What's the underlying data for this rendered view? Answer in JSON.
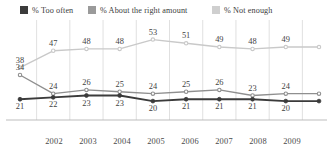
{
  "legend": {
    "items": [
      {
        "label": "% Too often",
        "color": "#3b3b3b",
        "swatch_name": "legend-swatch-too-often",
        "x": 20
      },
      {
        "label": "% About the right amount",
        "color": "#9a9a9a",
        "swatch_name": "legend-swatch-about-right",
        "x": 88
      },
      {
        "label": "% Not enough",
        "color": "#cfcfcf",
        "swatch_name": "legend-swatch-not-enough",
        "x": 212
      }
    ]
  },
  "chart_data": {
    "type": "line",
    "title": "",
    "subtitle": "",
    "xlabel": "",
    "ylabel": "",
    "grid": true,
    "legend_position": "top",
    "ylim": [
      0,
      60
    ],
    "xlim": [
      0,
      9
    ],
    "x": [
      0,
      1,
      2,
      3,
      4,
      5,
      6,
      7,
      8,
      9
    ],
    "categories": [
      "",
      "2002",
      "2003",
      "2004",
      "2005",
      "2006",
      "2007",
      "2008",
      "2009",
      ""
    ],
    "tick_labels": [
      "2002",
      "2003",
      "2004",
      "2005",
      "2006",
      "2007",
      "2008",
      "2009"
    ],
    "series": [
      {
        "name": "% Not enough",
        "color": "#c9c9c9",
        "marker": "open-circle",
        "values": [
          38,
          47,
          48,
          48,
          53,
          51,
          49,
          48,
          49,
          49
        ],
        "labels": [
          "38",
          "47",
          "48",
          "48",
          "53",
          "51",
          "49",
          "48",
          "49",
          ""
        ]
      },
      {
        "name": "% About the right amount",
        "color": "#8f8f8f",
        "marker": "open-circle",
        "values": [
          34,
          24,
          26,
          25,
          24,
          25,
          26,
          23,
          24,
          24
        ],
        "labels": [
          "34",
          "24",
          "26",
          "25",
          "24",
          "25",
          "26",
          "23",
          "24",
          ""
        ]
      },
      {
        "name": "% Too often",
        "color": "#3b3b3b",
        "marker": "filled-circle",
        "values": [
          21,
          22,
          23,
          23,
          20,
          21,
          21,
          21,
          20,
          20
        ],
        "labels": [
          "21",
          "22",
          "23",
          "23",
          "20",
          "21",
          "21",
          "21",
          "20",
          ""
        ]
      }
    ]
  },
  "axis": {
    "ticks": [
      {
        "label": "2002",
        "x": 54
      },
      {
        "label": "2003",
        "x": 88
      },
      {
        "label": "2004",
        "x": 122
      },
      {
        "label": "2005",
        "x": 156
      },
      {
        "label": "2006",
        "x": 190
      },
      {
        "label": "2007",
        "x": 224
      },
      {
        "label": "2008",
        "x": 258
      },
      {
        "label": "2009",
        "x": 292
      }
    ]
  },
  "colors": {
    "too_often": "#3b3b3b",
    "about_right": "#8f8f8f",
    "not_enough": "#c9c9c9",
    "gridline": "#d8d8d8",
    "axisline": "#b5b5b5",
    "text": "#3c3c3c",
    "background": "#ffffff"
  }
}
